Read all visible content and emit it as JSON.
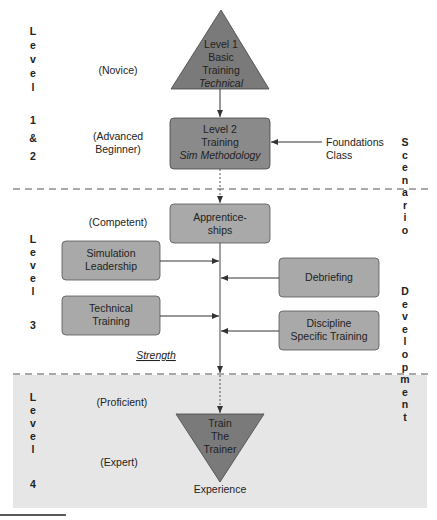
{
  "colors": {
    "background": "#ffffff",
    "dark_shape": "#7a7a7a",
    "box_fill": "#a9a9a9",
    "level2_fill": "#8a8a8a",
    "expert_band": "#e6e6e6",
    "line": "#333333",
    "dash": "#555555"
  },
  "left_labels": {
    "level_1_2": [
      "L",
      "e",
      "v",
      "e",
      "l",
      "",
      "1",
      "&",
      "2"
    ],
    "level_3": [
      "L",
      "e",
      "v",
      "e",
      "l",
      "",
      "3"
    ],
    "level_4": [
      "L",
      "e",
      "v",
      "e",
      "l",
      "",
      "4"
    ]
  },
  "stages": {
    "novice": "(Novice)",
    "advanced_beginner_line1": "(Advanced",
    "advanced_beginner_line2": "Beginner)",
    "competent": "(Competent)",
    "proficient": "(Proficient)",
    "expert": "(Expert)"
  },
  "nodes": {
    "level1": {
      "line1": "Level 1",
      "line2": "Basic",
      "line3": "Training",
      "line4": "Technical"
    },
    "level2": {
      "line1": "Level 2",
      "line2": "Training",
      "line3": "Sim Methodology"
    },
    "foundations": {
      "line1": "Foundations",
      "line2": "Class"
    },
    "apprenticeships": {
      "line1": "Apprentice-",
      "line2": "ships"
    },
    "simulation_leadership": {
      "line1": "Simulation",
      "line2": "Leadership"
    },
    "technical_training": {
      "line1": "Technical",
      "line2": "Training"
    },
    "debriefing": {
      "line1": "Debriefing"
    },
    "discipline": {
      "line1": "Discipline",
      "line2": "Specific Training"
    },
    "train_the_trainer": {
      "line1": "Train",
      "line2": "The",
      "line3": "Trainer"
    }
  },
  "annotations": {
    "strength": "Strength",
    "experience": "Experience"
  },
  "right_labels": {
    "scenario": [
      "S",
      "c",
      "e",
      "n",
      "a",
      "r",
      "i",
      "o"
    ],
    "development": [
      "D",
      "e",
      "v",
      "e",
      "l",
      "o",
      "p",
      "m",
      "e",
      "n",
      "t"
    ]
  }
}
